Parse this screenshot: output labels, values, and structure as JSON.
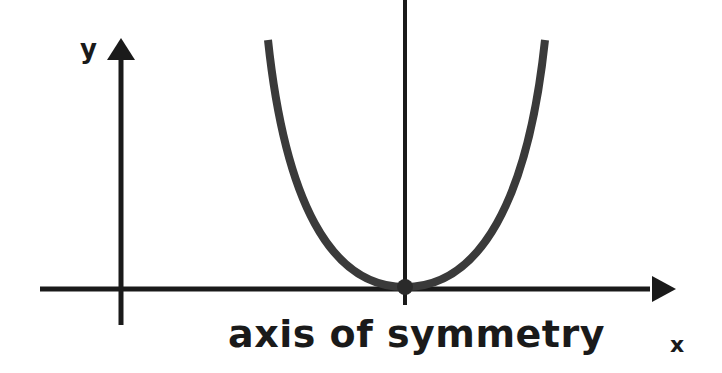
{
  "diagram": {
    "axes": {
      "x_label": "x",
      "y_label": "y"
    },
    "caption": "axis of symmetry",
    "parabola": {
      "vertex": "on x-axis",
      "opens": "up"
    },
    "colors": {
      "axes": "#1a1a1a",
      "parabola": "#3a3a3a",
      "vertex_dot": "#2a2a2a"
    }
  }
}
